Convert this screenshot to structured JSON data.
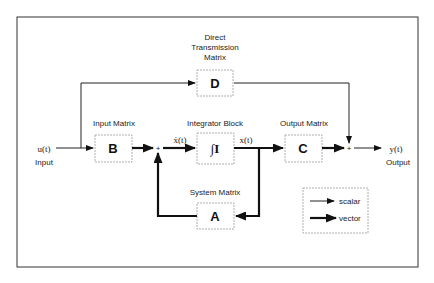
{
  "diagram": {
    "type": "state-space block diagram",
    "blocks": {
      "D": {
        "label": "D",
        "title_lines": [
          "Direct",
          "Transmission",
          "Matrix"
        ]
      },
      "B": {
        "label": "B",
        "title": "Input Matrix"
      },
      "I": {
        "label": "∫I",
        "title": "Integrator Block"
      },
      "C": {
        "label": "C",
        "title": "Output Matrix"
      },
      "A": {
        "label": "A",
        "title": "System Matrix"
      }
    },
    "signals": {
      "input": "u(t)",
      "input_label": "Input",
      "xdot": "ẋ(t)",
      "x": "x(t)",
      "output": "y(t)",
      "output_label": "Output"
    },
    "summing_junctions": [
      {
        "id": "sum1",
        "symbol": "+"
      },
      {
        "id": "sum2",
        "symbol": "+"
      }
    ],
    "legend": {
      "items": [
        {
          "style": "thin-arrow",
          "label": "scalar"
        },
        {
          "style": "thick-arrow",
          "label": "vector"
        }
      ]
    },
    "colors": {
      "line": "#111111",
      "frame": "#333333",
      "block_border": "#9a9a9a",
      "background": "#ffffff"
    }
  }
}
